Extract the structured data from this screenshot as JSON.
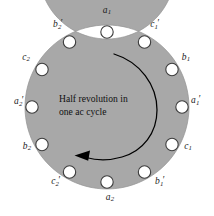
{
  "figure": {
    "type": "stator-winding-diagram",
    "caption_lines": [
      "Half revolution in",
      "one ac cycle"
    ],
    "rotation_direction": "clockwise",
    "slot_count": 12,
    "colors": {
      "ring_fill": "#a8a8a8",
      "ring_stroke": "#8f8f8f",
      "slot_fill": "#ffffff",
      "slot_stroke": "#3c3c3c",
      "arrow": "#000000",
      "text": "#111111",
      "background": "#ffffff"
    },
    "geometry": {
      "center_x": 107,
      "center_y": 107,
      "outer_radius": 82,
      "inner_radius": 68,
      "slot_radius": 75,
      "slot_hole_radius": 6.2,
      "label_radius": 96
    },
    "slots": [
      {
        "id": "slot-a1",
        "label": "a",
        "sub": "1",
        "prime": false,
        "angle_deg": 0,
        "label_x": 107,
        "label_y": 11,
        "cx": 107,
        "cy": 32
      },
      {
        "id": "slot-c1-prime",
        "label": "c",
        "sub": "1",
        "prime": true,
        "angle_deg": 30,
        "label_x": 155,
        "label_y": 25,
        "cx": 144.5,
        "cy": 42
      },
      {
        "id": "slot-b1",
        "label": "b",
        "sub": "1",
        "prime": false,
        "angle_deg": 60,
        "label_x": 186,
        "label_y": 58,
        "cx": 172,
        "cy": 69.5
      },
      {
        "id": "slot-a1-prime",
        "label": "a",
        "sub": "1",
        "prime": true,
        "angle_deg": 90,
        "label_x": 196,
        "label_y": 101,
        "cx": 182,
        "cy": 107
      },
      {
        "id": "slot-c1",
        "label": "c",
        "sub": "1",
        "prime": false,
        "angle_deg": 120,
        "label_x": 188,
        "label_y": 147,
        "cx": 172,
        "cy": 144.5
      },
      {
        "id": "slot-b1-prime",
        "label": "b",
        "sub": "1",
        "prime": true,
        "angle_deg": 150,
        "label_x": 160,
        "label_y": 182,
        "cx": 144.5,
        "cy": 172
      },
      {
        "id": "slot-a2",
        "label": "a",
        "sub": "2",
        "prime": false,
        "angle_deg": 180,
        "label_x": 110,
        "label_y": 198,
        "cx": 107,
        "cy": 182
      },
      {
        "id": "slot-c2-prime",
        "label": "c",
        "sub": "2",
        "prime": true,
        "angle_deg": 210,
        "label_x": 56,
        "label_y": 182,
        "cx": 69.5,
        "cy": 172
      },
      {
        "id": "slot-b2",
        "label": "b",
        "sub": "2",
        "prime": false,
        "angle_deg": 240,
        "label_x": 27,
        "label_y": 147,
        "cx": 42,
        "cy": 144.5
      },
      {
        "id": "slot-a2-prime",
        "label": "a",
        "sub": "2",
        "prime": true,
        "angle_deg": 270,
        "label_x": 19,
        "label_y": 102,
        "cx": 32,
        "cy": 107
      },
      {
        "id": "slot-c2",
        "label": "c",
        "sub": "2",
        "prime": false,
        "angle_deg": 300,
        "label_x": 26,
        "label_y": 58,
        "cx": 42,
        "cy": 69.5
      },
      {
        "id": "slot-b2-prime",
        "label": "b",
        "sub": "2",
        "prime": true,
        "angle_deg": 330,
        "label_x": 58,
        "label_y": 25,
        "cx": 69.5,
        "cy": 42
      }
    ],
    "arrow": {
      "description": "clockwise arc from top-center to bottom-left with arrowhead",
      "start_x": 115,
      "start_y": 55,
      "end_x": 76,
      "end_y": 157
    }
  }
}
